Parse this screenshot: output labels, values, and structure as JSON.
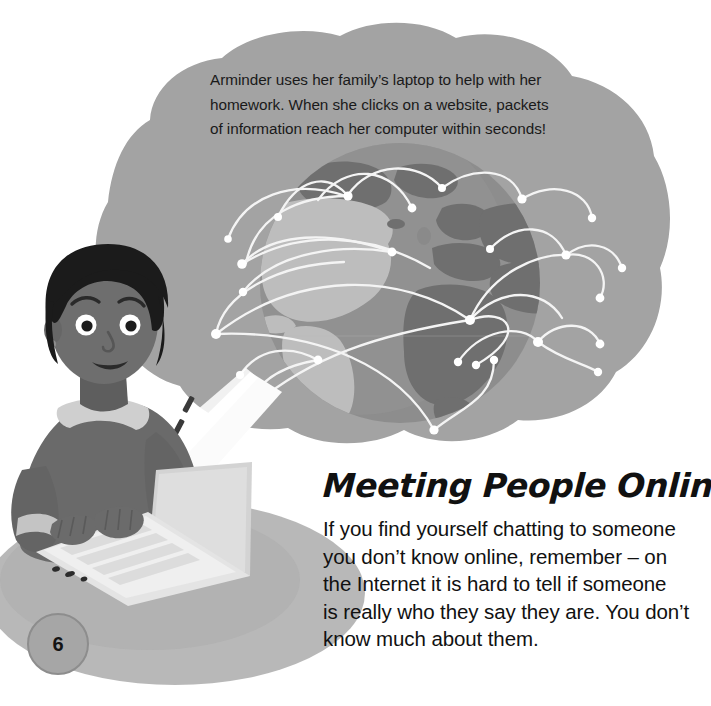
{
  "page": {
    "number": "6",
    "background_color": "#ffffff"
  },
  "cloud": {
    "name": "thought-cloud",
    "fill_color": "#a3a3a3",
    "text_lines": [
      "Arminder uses her family’s laptop to help with her",
      "homework. When she clicks on a website, packets",
      "of information reach her computer within seconds!"
    ],
    "text_color": "#1a1a1a"
  },
  "globe": {
    "name": "world-globe",
    "ocean_color": "#8f8f8f",
    "land_color": "#b8b8b8",
    "dark_land_color": "#7a7a7a",
    "connection_line_color": "#f2f2f2",
    "node_color": "#ffffff",
    "node_count": 22
  },
  "character": {
    "name": "girl-at-laptop",
    "skin_color": "#6e6e6e",
    "hair_color": "#1b1b1b",
    "sweater_color": "#6a6a6a",
    "collar_color": "#c9c9c9",
    "laptop_body_color": "#d8d8d8",
    "laptop_screen_color": "#f7f7f7",
    "keyboard_color": "#f0f0f0",
    "beam_color": "#fbfbfb",
    "ground_shadow_color": "#b4b4b4"
  },
  "article": {
    "heading": "Meeting People Online",
    "body_lines": [
      "If you find yourself chatting to someone",
      "you don’t know online, remember – on",
      "the Internet it is hard to tell if someone",
      "is really who they say they are. You don’t",
      "know much about them."
    ],
    "text_color": "#111111"
  }
}
